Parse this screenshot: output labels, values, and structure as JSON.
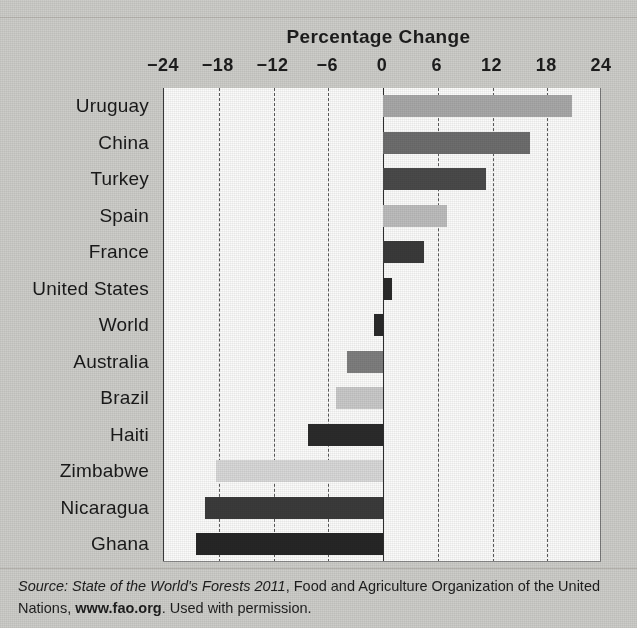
{
  "figure": {
    "cropped_header_text": "",
    "title": "Percentage Change"
  },
  "source_note": {
    "label": "Source:",
    "title_italic": "State of the World's Forests 2011",
    "middle": ", Food and Agriculture Organization of the United Nations,",
    "url": "www.fao.org",
    "tail": ". Used with permission."
  },
  "chart_data": {
    "type": "bar",
    "orientation": "horizontal",
    "title": "Percentage Change",
    "xlabel": "Percentage Change",
    "ylabel": "",
    "xlim": [
      -24,
      24
    ],
    "xticks": [
      -24,
      -18,
      -12,
      -6,
      0,
      6,
      12,
      18,
      24
    ],
    "xtick_labels": [
      "−24",
      "−18",
      "−12",
      "−6",
      "0",
      "6",
      "12",
      "18",
      "24"
    ],
    "grid": true,
    "grid_axis": "x",
    "legend": "none",
    "categories": [
      "Uruguay",
      "China",
      "Turkey",
      "Spain",
      "France",
      "United States",
      "World",
      "Australia",
      "Brazil",
      "Haiti",
      "Zimbabwe",
      "Nicaragua",
      "Ghana"
    ],
    "values": [
      20.7,
      16.1,
      11.3,
      7.0,
      4.5,
      1.0,
      -1.0,
      -4.0,
      -5.2,
      -8.2,
      -18.3,
      -19.5,
      -20.5
    ],
    "bar_colors": [
      "#a8a8a8",
      "#6e6e6e",
      "#4a4a4a",
      "#bdbdbd",
      "#3a3a3a",
      "#2a2a2a",
      "#2a2a2a",
      "#7e7e7e",
      "#c9c9c9",
      "#2b2b2b",
      "#d8d8d8",
      "#3b3b3b",
      "#262626"
    ]
  },
  "colors": {
    "page_background": "#cdcdc9",
    "plot_background": "#fbfbfa",
    "axis": "#2e2e2e",
    "gridline": "#5a5a5a",
    "text": "#1a1a1a"
  }
}
